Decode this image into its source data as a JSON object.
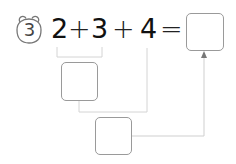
{
  "problem": {
    "number": "3",
    "terms": [
      "2",
      "3",
      "4"
    ],
    "operators": [
      "+",
      "+",
      "="
    ],
    "answer_box": "",
    "step_box_1": "",
    "step_box_2": ""
  },
  "colors": {
    "text": "#111111",
    "box_border": "#9a9a9a",
    "line": "#cfcfcf",
    "arrow": "#777777"
  }
}
